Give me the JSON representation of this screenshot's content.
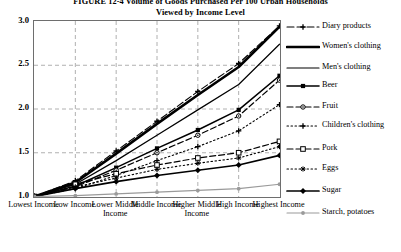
{
  "title": {
    "line1": "FIGURE 12-4  Volume of Goods Purchased Per 100 Urban Households",
    "line2": "Viewed by Income Level"
  },
  "chart_data": {
    "type": "line",
    "title": "FIGURE 12-4  Volume of Goods Purchased Per 100 Urban Households Viewed by Income Level",
    "xlabel": "",
    "ylabel": "",
    "ylim": [
      1.0,
      3.0
    ],
    "yticks": [
      "1.0",
      "1.5",
      "2.0",
      "2.5",
      "3.0"
    ],
    "ytick_values": [
      1.0,
      1.5,
      2.0,
      2.5,
      3.0
    ],
    "grid": true,
    "legend_position": "right",
    "categories": [
      "Lowest Income",
      "Low Income",
      "Lower Middle Income",
      "Middle Income",
      "Higher Middle Income",
      "High Income",
      "Highest Income"
    ],
    "series": [
      {
        "name": "Diary products",
        "values": [
          1.0,
          1.18,
          1.52,
          1.86,
          2.2,
          2.52,
          2.95
        ]
      },
      {
        "name": "Women's clothing",
        "values": [
          1.0,
          1.16,
          1.49,
          1.83,
          2.16,
          2.48,
          2.94
        ]
      },
      {
        "name": "Men's clothing",
        "values": [
          1.0,
          1.14,
          1.41,
          1.7,
          1.99,
          2.28,
          2.74
        ]
      },
      {
        "name": "Beer",
        "values": [
          1.0,
          1.12,
          1.33,
          1.55,
          1.76,
          1.99,
          2.38
        ]
      },
      {
        "name": "Fruit",
        "values": [
          1.0,
          1.11,
          1.3,
          1.5,
          1.7,
          1.92,
          2.33
        ]
      },
      {
        "name": "Children's clothing",
        "values": [
          1.0,
          1.09,
          1.24,
          1.41,
          1.57,
          1.75,
          2.05
        ]
      },
      {
        "name": "Pork",
        "values": [
          1.0,
          1.14,
          1.26,
          1.36,
          1.44,
          1.5,
          1.63
        ]
      },
      {
        "name": "Eggs",
        "values": [
          1.0,
          1.11,
          1.21,
          1.31,
          1.38,
          1.44,
          1.57
        ]
      },
      {
        "name": "Sugar",
        "values": [
          1.0,
          1.09,
          1.17,
          1.24,
          1.3,
          1.36,
          1.47
        ]
      },
      {
        "name": "Starch, potatoes",
        "values": [
          1.0,
          1.01,
          1.03,
          1.05,
          1.07,
          1.09,
          1.14
        ]
      }
    ]
  },
  "legend": {
    "items": [
      {
        "label": "Diary products",
        "marker": "plus-dashed-icon"
      },
      {
        "label": "Women's clothing",
        "marker": "thick-solid-line-icon"
      },
      {
        "label": "Men's clothing",
        "marker": "thin-solid-line-icon"
      },
      {
        "label": "Beer",
        "marker": "solid-square-marker-icon"
      },
      {
        "label": "Fruit",
        "marker": "dashed-circle-marker-icon"
      },
      {
        "label": "Children's clothing",
        "marker": "dotted-plus-marker-icon"
      },
      {
        "label": "Pork",
        "marker": "dashed-open-square-icon"
      },
      {
        "label": "Eggs",
        "marker": "dotted-star-marker-icon"
      },
      {
        "label": "Sugar",
        "marker": "solid-diamond-marker-icon"
      },
      {
        "label": "Starch, potatoes",
        "marker": "grey-solid-dot-icon"
      }
    ]
  },
  "colors": {
    "line": "#000000",
    "grey_line": "#9a9a9a",
    "frame": "#6e6e6e",
    "grid": "#b0b0b0",
    "background": "#ffffff"
  }
}
